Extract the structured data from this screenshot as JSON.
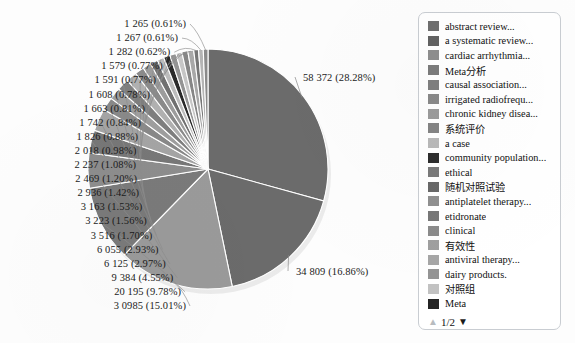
{
  "chart_data": {
    "type": "pie",
    "title": "",
    "xlabel": "",
    "ylabel": "",
    "total": 206410,
    "legend_position": "right",
    "grid": false,
    "slices": [
      {
        "label": "58 372 (28.28%)",
        "value": 58372,
        "percent": 28.28,
        "color": "#6b6b6b"
      },
      {
        "label": "34 809 (16.86%)",
        "value": 34809,
        "percent": 16.86,
        "color": "#6b6b6b"
      },
      {
        "label": "3 0985 (15.01%)",
        "value": 30985,
        "percent": 15.01,
        "color": "#9a9a9a"
      },
      {
        "label": "20 195 (9.78%)",
        "value": 20195,
        "percent": 9.78,
        "color": "#7a7a7a"
      },
      {
        "label": "9 384 (4.55%)",
        "value": 9384,
        "percent": 4.55,
        "color": "#8d8d8d"
      },
      {
        "label": "6 125 (2.97%)",
        "value": 6125,
        "percent": 2.97,
        "color": "#777777"
      },
      {
        "label": "6 055 (2.93%)",
        "value": 6055,
        "percent": 2.93,
        "color": "#a4a4a4"
      },
      {
        "label": "3 516 (1.70%)",
        "value": 3516,
        "percent": 1.7,
        "color": "#888888"
      },
      {
        "label": "3 223 (1.56%)",
        "value": 3223,
        "percent": 1.56,
        "color": "#9e9e9e"
      },
      {
        "label": "3 163 (1.53%)",
        "value": 3163,
        "percent": 1.53,
        "color": "#7e7e7e"
      },
      {
        "label": "2 936 (1.42%)",
        "value": 2936,
        "percent": 1.42,
        "color": "#b0b0b0"
      },
      {
        "label": "2 469 (1.20%)",
        "value": 2469,
        "percent": 1.2,
        "color": "#8a8a8a"
      },
      {
        "label": "2 237 (1.08%)",
        "value": 2237,
        "percent": 1.08,
        "color": "#9c9c9c"
      },
      {
        "label": "2 018 (0.98%)",
        "value": 2018,
        "percent": 0.98,
        "color": "#707070"
      },
      {
        "label": "1 826 (0.88%)",
        "value": 1826,
        "percent": 0.88,
        "color": "#bcbcbc"
      },
      {
        "label": "1 742 (0.84%)",
        "value": 1742,
        "percent": 0.84,
        "color": "#2a2a2a"
      },
      {
        "label": "1 663 (0.81%)",
        "value": 1663,
        "percent": 0.81,
        "color": "#949494"
      },
      {
        "label": "1 608 (0.78%)",
        "value": 1608,
        "percent": 0.78,
        "color": "#c6c6c6"
      },
      {
        "label": "1 591 (0.77%)",
        "value": 1591,
        "percent": 0.77,
        "color": "#868686"
      },
      {
        "label": "1 579 (0.77%)",
        "value": 1579,
        "percent": 0.77,
        "color": "#a8a8a8"
      },
      {
        "label": "1 282 (0.62%)",
        "value": 1282,
        "percent": 0.62,
        "color": "#767676"
      },
      {
        "label": "1 267 (0.61%)",
        "value": 1267,
        "percent": 0.61,
        "color": "#b4b4b4"
      },
      {
        "label": "1 265 (0.61%)",
        "value": 1265,
        "percent": 0.61,
        "color": "#9090ff00"
      }
    ],
    "left_labels": [
      "1 265 (0.61%)",
      "1 267 (0.61%)",
      "1 282 (0.62%)",
      "1 579 (0.77%)",
      "1 591 (0.77%)",
      "1 608 (0.78%)",
      "1 663 (0.81%)",
      "1 742 (0.84%)",
      "1 826 (0.88%)",
      "2 018 (0.98%)",
      "2 237 (1.08%)",
      "2 469 (1.20%)",
      "2 936 (1.42%)",
      "3 163 (1.53%)",
      "3 223 (1.56%)",
      "3 516 (1.70%)",
      "6 055 (2.93%)",
      "6 125 (2.97%)",
      "9 384 (4.55%)",
      "20 195 (9.78%)",
      "3 0985 (15.01%)"
    ],
    "right_labels": [
      "58 372 (28.28%)",
      "34 809 (16.86%)"
    ]
  },
  "legend": {
    "items": [
      {
        "label": "abstract review...",
        "color": "#6f6f6f"
      },
      {
        "label": "a systematic review...",
        "color": "#626262"
      },
      {
        "label": "cardiac arrhythmia...",
        "color": "#8e8e8e"
      },
      {
        "label": "Meta分析",
        "color": "#7b7b7b"
      },
      {
        "label": "causal association...",
        "color": "#7f7f7f"
      },
      {
        "label": "irrigated radiofrequ...",
        "color": "#898989"
      },
      {
        "label": "chronic kidney disea...",
        "color": "#9b9b9b"
      },
      {
        "label": "系统评价",
        "color": "#848484"
      },
      {
        "label": "a case",
        "color": "#b9b9b9"
      },
      {
        "label": "community population...",
        "color": "#2d2d2d"
      },
      {
        "label": "ethical",
        "color": "#7a7a7a"
      },
      {
        "label": "随机对照试验",
        "color": "#686868"
      },
      {
        "label": "antiplatelet therapy...",
        "color": "#909090"
      },
      {
        "label": "etidronate",
        "color": "#777777"
      },
      {
        "label": "clinical",
        "color": "#8b8b8b"
      },
      {
        "label": "有效性",
        "color": "#9f9f9f"
      },
      {
        "label": "antiviral therapy...",
        "color": "#a6a6a6"
      },
      {
        "label": "dairy products.",
        "color": "#949494"
      },
      {
        "label": "对照组",
        "color": "#c2c2c2"
      },
      {
        "label": "Meta",
        "color": "#242424"
      }
    ],
    "pager": {
      "up_icon": "triangle-up-icon",
      "down_icon": "triangle-down-icon",
      "page_text": "1/2"
    }
  }
}
